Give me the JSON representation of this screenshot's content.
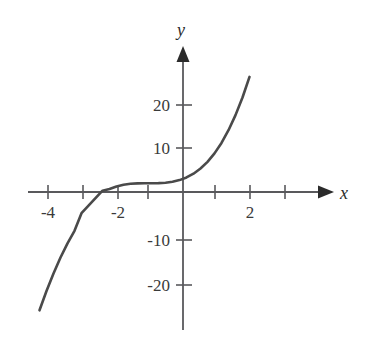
{
  "chart_data": {
    "type": "line",
    "title": "",
    "xlabel": "x",
    "ylabel": "y",
    "function": "y = (x + 1)^3 + 2",
    "grid": false,
    "legend": null,
    "xlim": [
      -4.45,
      3.0
    ],
    "ylim": [
      -27,
      29
    ],
    "xticks": [
      -4,
      -3,
      -2,
      -1,
      0,
      1,
      2,
      3
    ],
    "xtick_labels": [
      "-4",
      "",
      "-2",
      "",
      "",
      "",
      "2",
      ""
    ],
    "yticks": [
      -20,
      -10,
      10,
      20
    ],
    "ytick_labels": [
      "-20",
      "-10",
      "10",
      "20"
    ],
    "x_axis_arrow": true,
    "y_axis_arrow": true,
    "curve_color": "#4a4a4a",
    "axis_color": "#59595c",
    "text_color": "#3a3a3a",
    "background": "#ffffff",
    "x": [
      -4.1,
      -3.9,
      -3.7,
      -3.5,
      -3.3,
      -3.1,
      -2.9,
      -2.7,
      -2.5,
      -2.3,
      -2.1,
      -1.9,
      -1.7,
      -1.5,
      -1.3,
      -1.1,
      -0.9,
      -0.7,
      -0.5,
      -0.3,
      -0.1,
      0.1,
      0.3,
      0.5,
      0.7,
      0.9,
      1.1,
      1.3,
      1.5,
      1.7,
      1.9
    ],
    "y": [
      -27.13,
      -22.71,
      -18.68,
      -15.03,
      -11.77,
      -8.89,
      -4.86,
      -3.13,
      -1.38,
      0.3,
      0.67,
      1.27,
      1.66,
      1.88,
      1.97,
      2.0,
      2.0,
      2.03,
      2.13,
      2.34,
      2.73,
      3.33,
      4.2,
      5.38,
      6.91,
      8.86,
      11.26,
      14.17,
      17.63,
      21.68,
      26.39
    ]
  },
  "figure": {
    "x_axis_label": "x",
    "y_axis_label": "y"
  }
}
